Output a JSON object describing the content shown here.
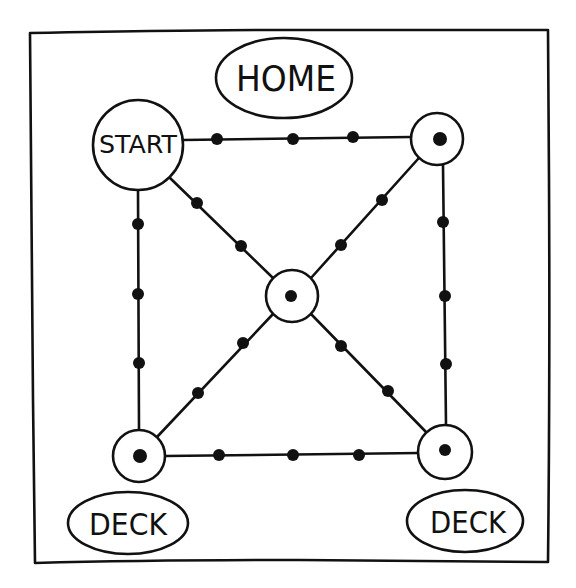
{
  "board": {
    "title": "Game board diagram",
    "colors": {
      "ink": "#111111",
      "paper": "#ffffff"
    },
    "frame": {
      "x1": 30,
      "y1": 32,
      "x2": 548,
      "y2": 562
    },
    "labels": {
      "home": "HOME",
      "start": "START",
      "deck_left": "DECK",
      "deck_right": "DECK"
    },
    "nodes": [
      {
        "id": "start",
        "label": "START",
        "x": 138,
        "y": 145,
        "r": 45,
        "has_dot": false
      },
      {
        "id": "top-right",
        "x": 437,
        "y": 140,
        "r": 26,
        "has_dot": true
      },
      {
        "id": "center",
        "x": 292,
        "y": 296,
        "r": 26,
        "has_dot": true
      },
      {
        "id": "bottom-left",
        "x": 138,
        "y": 456,
        "r": 27,
        "has_dot": true
      },
      {
        "id": "bottom-right",
        "x": 445,
        "y": 452,
        "r": 27,
        "has_dot": true
      }
    ],
    "paths": [
      {
        "from": "start",
        "to": "top-right",
        "steps": [
          [
            217,
            139
          ],
          [
            293,
            139
          ],
          [
            353,
            137
          ]
        ]
      },
      {
        "from": "start",
        "to": "bottom-left",
        "steps": [
          [
            138,
            224
          ],
          [
            138,
            294
          ],
          [
            139,
            363
          ]
        ]
      },
      {
        "from": "top-right",
        "to": "bottom-right",
        "steps": [
          [
            443,
            222
          ],
          [
            445,
            296
          ],
          [
            446,
            364
          ]
        ]
      },
      {
        "from": "bottom-left",
        "to": "bottom-right",
        "steps": [
          [
            219,
            455
          ],
          [
            293,
            455
          ],
          [
            359,
            455
          ]
        ]
      },
      {
        "from": "start",
        "to": "center",
        "steps": [
          [
            197,
            203
          ],
          [
            241,
            246
          ]
        ]
      },
      {
        "from": "top-right",
        "to": "center",
        "steps": [
          [
            382,
            200
          ],
          [
            341,
            245
          ]
        ]
      },
      {
        "from": "bottom-left",
        "to": "center",
        "steps": [
          [
            198,
            393
          ],
          [
            243,
            343
          ]
        ]
      },
      {
        "from": "center",
        "to": "bottom-right",
        "steps": [
          [
            341,
            346
          ],
          [
            388,
            391
          ]
        ]
      }
    ],
    "ovals": [
      {
        "id": "home",
        "label": "HOME",
        "cx": 284,
        "cy": 78,
        "rx": 68,
        "ry": 40
      },
      {
        "id": "deck-left",
        "label": "DECK",
        "cx": 128,
        "cy": 523,
        "rx": 60,
        "ry": 31
      },
      {
        "id": "deck-right",
        "label": "DECK",
        "cx": 465,
        "cy": 521,
        "rx": 58,
        "ry": 31
      }
    ]
  }
}
